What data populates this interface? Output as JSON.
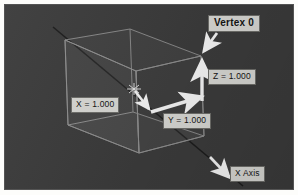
{
  "viewport": {
    "background_color": "#3b3b3b",
    "border_color": "#545454",
    "page_background": "#fdfdfb"
  },
  "scene": {
    "name": "3d-wireframe-cube-viewport",
    "wireframe_color": "#8f8f8f",
    "axis_line_color": "#1b1b1b",
    "arrow_color": "#f2f2f2",
    "origin_marker": "origin-star-marker"
  },
  "annotations": {
    "vertex": {
      "label": "Vertex 0",
      "bold": true
    },
    "z_measure": {
      "label": "Z = 1.000"
    },
    "x_measure": {
      "label": "X = 1.000"
    },
    "y_measure": {
      "label": "Y = 1.000"
    },
    "x_axis": {
      "label": "X Axis"
    }
  },
  "callout_colors": {
    "box_fill": "#d6d6d2",
    "box_border": "#6e6e6a",
    "text": "#141414"
  }
}
